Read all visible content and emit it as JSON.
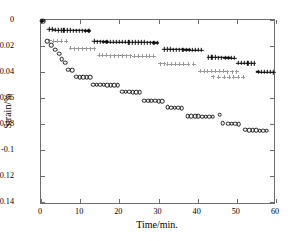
{
  "chart_data": {
    "type": "scatter",
    "title": "",
    "xlabel": "Time/min.",
    "ylabel": "Strain/%",
    "xlim": [
      0,
      60
    ],
    "ylim": [
      -0.1423,
      0.0
    ],
    "xticks": [
      0,
      10,
      20,
      30,
      40,
      50,
      60
    ],
    "xticklabels": [
      "0",
      "10",
      "20",
      "30",
      "40",
      "50",
      "60"
    ],
    "yticks": [
      0,
      -0.02,
      -0.04,
      -0.06,
      -0.08,
      -0.1,
      -0.12,
      -0.14
    ],
    "yticklabels": [
      "0",
      "-0.02",
      "-0.04",
      "-0.06",
      "-0.08",
      "-0.1",
      "-0.12",
      "-0.14"
    ],
    "grid": false,
    "legend": "none",
    "series": [
      {
        "name": "specimen-circles",
        "marker": "circle-open",
        "color": "#1a1a1a",
        "points": [
          [
            0.2,
            -0.0005
          ],
          [
            0.6,
            -0.001
          ],
          [
            1.6,
            -0.0162
          ],
          [
            2.6,
            -0.0192
          ],
          [
            3.6,
            -0.0228
          ],
          [
            4.7,
            -0.0258
          ],
          [
            5.3,
            -0.03
          ],
          [
            6.2,
            -0.033
          ],
          [
            7.0,
            -0.0381
          ],
          [
            7.9,
            -0.0386
          ],
          [
            9.0,
            -0.0435
          ],
          [
            9.9,
            -0.0438
          ],
          [
            10.8,
            -0.0438
          ],
          [
            11.7,
            -0.0438
          ],
          [
            12.6,
            -0.0439
          ],
          [
            13.3,
            -0.0497
          ],
          [
            14.2,
            -0.0499
          ],
          [
            15.1,
            -0.0499
          ],
          [
            16.0,
            -0.0499
          ],
          [
            16.9,
            -0.05
          ],
          [
            17.8,
            -0.05
          ],
          [
            18.7,
            -0.05
          ],
          [
            19.6,
            -0.0501
          ],
          [
            20.7,
            -0.0551
          ],
          [
            21.6,
            -0.0553
          ],
          [
            22.5,
            -0.0553
          ],
          [
            23.4,
            -0.0554
          ],
          [
            24.3,
            -0.0556
          ],
          [
            25.2,
            -0.0557
          ],
          [
            26.4,
            -0.062
          ],
          [
            27.3,
            -0.0621
          ],
          [
            28.2,
            -0.0621
          ],
          [
            29.1,
            -0.0622
          ],
          [
            30.0,
            -0.0623
          ],
          [
            30.9,
            -0.0624
          ],
          [
            32.3,
            -0.0673
          ],
          [
            33.2,
            -0.0674
          ],
          [
            34.1,
            -0.0675
          ],
          [
            35.0,
            -0.0676
          ],
          [
            35.9,
            -0.0677
          ],
          [
            37.5,
            -0.0739
          ],
          [
            38.4,
            -0.074
          ],
          [
            39.3,
            -0.0741
          ],
          [
            40.2,
            -0.0742
          ],
          [
            41.1,
            -0.0743
          ],
          [
            42.0,
            -0.0744
          ],
          [
            42.9,
            -0.0745
          ],
          [
            43.8,
            -0.0745
          ],
          [
            45.6,
            -0.0727
          ],
          [
            46.4,
            -0.0794
          ],
          [
            47.8,
            -0.0797
          ],
          [
            48.7,
            -0.0798
          ],
          [
            49.6,
            -0.0799
          ],
          [
            50.5,
            -0.08
          ],
          [
            52.2,
            -0.0845
          ],
          [
            53.1,
            -0.0847
          ],
          [
            54.0,
            -0.0848
          ],
          [
            54.9,
            -0.0849
          ],
          [
            55.8,
            -0.085
          ],
          [
            56.7,
            -0.0851
          ],
          [
            57.6,
            -0.0852
          ]
        ]
      },
      {
        "name": "specimen-plus-bold",
        "marker": "plus",
        "color": "#111111",
        "points": [
          [
            0.3,
            -0.0008
          ],
          [
            2.1,
            -0.0072
          ],
          [
            2.9,
            -0.0073
          ],
          [
            3.6,
            -0.0076
          ],
          [
            4.3,
            -0.0078
          ],
          [
            5.1,
            -0.0079
          ],
          [
            5.8,
            -0.0079
          ],
          [
            6.6,
            -0.008
          ],
          [
            7.4,
            -0.008
          ],
          [
            8.2,
            -0.0081
          ],
          [
            9.0,
            -0.0081
          ],
          [
            9.8,
            -0.0082
          ],
          [
            10.6,
            -0.0082
          ],
          [
            11.4,
            -0.0083
          ],
          [
            12.2,
            -0.0083
          ],
          [
            13.6,
            -0.0165
          ],
          [
            14.4,
            -0.0166
          ],
          [
            15.2,
            -0.0166
          ],
          [
            16.0,
            -0.0167
          ],
          [
            16.8,
            -0.0167
          ],
          [
            17.6,
            -0.0168
          ],
          [
            18.4,
            -0.0168
          ],
          [
            19.2,
            -0.0169
          ],
          [
            20.0,
            -0.0169
          ],
          [
            20.8,
            -0.017
          ],
          [
            21.6,
            -0.017
          ],
          [
            22.4,
            -0.0171
          ],
          [
            23.2,
            -0.0171
          ],
          [
            24.0,
            -0.0172
          ],
          [
            24.8,
            -0.0172
          ],
          [
            25.6,
            -0.0173
          ],
          [
            26.4,
            -0.0173
          ],
          [
            27.2,
            -0.0174
          ],
          [
            28.0,
            -0.0174
          ],
          [
            28.8,
            -0.0175
          ],
          [
            29.6,
            -0.0175
          ],
          [
            31.4,
            -0.0225
          ],
          [
            32.2,
            -0.0226
          ],
          [
            33.0,
            -0.0226
          ],
          [
            33.8,
            -0.0227
          ],
          [
            34.6,
            -0.0227
          ],
          [
            35.4,
            -0.0228
          ],
          [
            36.2,
            -0.0228
          ],
          [
            37.0,
            -0.0229
          ],
          [
            37.8,
            -0.0229
          ],
          [
            38.6,
            -0.023
          ],
          [
            39.4,
            -0.023
          ],
          [
            40.2,
            -0.0231
          ],
          [
            41.0,
            -0.0231
          ],
          [
            42.8,
            -0.0287
          ],
          [
            43.6,
            -0.0288
          ],
          [
            44.4,
            -0.0288
          ],
          [
            45.2,
            -0.0289
          ],
          [
            46.0,
            -0.0289
          ],
          [
            47.0,
            -0.029
          ],
          [
            47.8,
            -0.029
          ],
          [
            48.6,
            -0.0291
          ],
          [
            49.4,
            -0.0291
          ],
          [
            50.4,
            -0.033
          ],
          [
            51.2,
            -0.0331
          ],
          [
            52.0,
            -0.0331
          ],
          [
            52.8,
            -0.0332
          ],
          [
            53.6,
            -0.0332
          ],
          [
            54.4,
            -0.0333
          ],
          [
            55.4,
            -0.0398
          ],
          [
            56.2,
            -0.0399
          ],
          [
            57.0,
            -0.0399
          ],
          [
            57.8,
            -0.04
          ],
          [
            58.6,
            -0.04
          ],
          [
            59.3,
            -0.0401
          ]
        ]
      },
      {
        "name": "specimen-plus-faint",
        "marker": "plus-light",
        "color": "#4a4a4a",
        "points": [
          [
            2.2,
            -0.016
          ],
          [
            3.2,
            -0.0161
          ],
          [
            4.2,
            -0.0162
          ],
          [
            5.2,
            -0.0162
          ],
          [
            6.4,
            -0.0163
          ],
          [
            7.6,
            -0.0219
          ],
          [
            8.6,
            -0.022
          ],
          [
            9.6,
            -0.022
          ],
          [
            10.6,
            -0.0221
          ],
          [
            11.6,
            -0.0221
          ],
          [
            12.6,
            -0.0222
          ],
          [
            13.6,
            -0.0222
          ],
          [
            14.8,
            -0.0272
          ],
          [
            15.8,
            -0.0273
          ],
          [
            16.8,
            -0.0273
          ],
          [
            17.8,
            -0.0274
          ],
          [
            18.8,
            -0.0274
          ],
          [
            19.8,
            -0.0275
          ],
          [
            20.8,
            -0.0275
          ],
          [
            21.8,
            -0.0276
          ],
          [
            22.8,
            -0.0276
          ],
          [
            23.8,
            -0.0277
          ],
          [
            24.8,
            -0.0277
          ],
          [
            25.8,
            -0.0278
          ],
          [
            26.8,
            -0.0278
          ],
          [
            27.8,
            -0.0279
          ],
          [
            28.8,
            -0.0279
          ],
          [
            30.4,
            -0.0337
          ],
          [
            31.4,
            -0.0337
          ],
          [
            32.4,
            -0.0338
          ],
          [
            33.4,
            -0.0338
          ],
          [
            34.4,
            -0.0339
          ],
          [
            35.4,
            -0.0339
          ],
          [
            36.4,
            -0.034
          ],
          [
            37.6,
            -0.0341
          ],
          [
            39.0,
            -0.034
          ],
          [
            40.6,
            -0.0393
          ],
          [
            41.6,
            -0.0394
          ],
          [
            42.6,
            -0.0394
          ],
          [
            43.6,
            -0.0395
          ],
          [
            44.6,
            -0.0395
          ],
          [
            45.6,
            -0.0396
          ],
          [
            46.6,
            -0.0396
          ],
          [
            47.6,
            -0.0397
          ],
          [
            48.8,
            -0.0397
          ],
          [
            50.0,
            -0.0398
          ],
          [
            44.0,
            -0.0437
          ],
          [
            45.4,
            -0.0438
          ],
          [
            46.8,
            -0.0438
          ],
          [
            48.0,
            -0.0439
          ],
          [
            49.2,
            -0.0439
          ],
          [
            50.4,
            -0.044
          ],
          [
            51.6,
            -0.044
          ]
        ]
      }
    ]
  },
  "axes": {
    "x_title": "Time/min.",
    "y_title": "Strain/%"
  }
}
